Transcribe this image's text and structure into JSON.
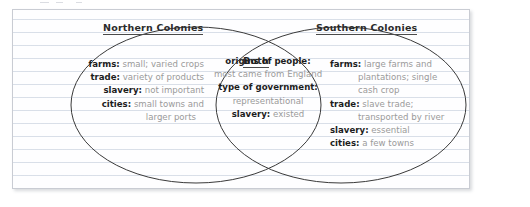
{
  "diagram": {
    "type": "venn-diagram",
    "kind": "two-set comparison",
    "left_set": {
      "title": "Northern Colonies",
      "entries": [
        {
          "label": "farms:",
          "value": "small; varied crops"
        },
        {
          "label": "trade:",
          "value": "variety of products"
        },
        {
          "label": "slavery:",
          "value": "not important"
        },
        {
          "label": "cities:",
          "value": "small towns and",
          "continuation": "larger ports"
        }
      ]
    },
    "overlap_set": {
      "title": "Both",
      "entries": [
        {
          "label": "origins of people:",
          "value": "most came from England"
        },
        {
          "label": "type of government:",
          "value": "representational"
        },
        {
          "label": "slavery:",
          "value": "existed"
        }
      ]
    },
    "right_set": {
      "title": "Southern Colonies",
      "entries": [
        {
          "label": "farms:",
          "value": "large farms and",
          "continuation": [
            "plantations; single",
            "cash crop"
          ]
        },
        {
          "label": "trade:",
          "value": "slave trade;",
          "continuation": [
            "transported by river"
          ]
        },
        {
          "label": "slavery:",
          "value": "essential"
        },
        {
          "label": "cities:",
          "value": "a few towns"
        }
      ]
    }
  },
  "colors": {
    "page_background": "#ffffff",
    "card_background": "#fefeff",
    "card_border": "#c9ccd3",
    "rule_line": "#bac5d6",
    "ellipse_stroke": "#3a3a3a",
    "label_text": "#1d1d1d",
    "value_text": "#9a9a9a",
    "title_text": "#2b2b2b"
  }
}
